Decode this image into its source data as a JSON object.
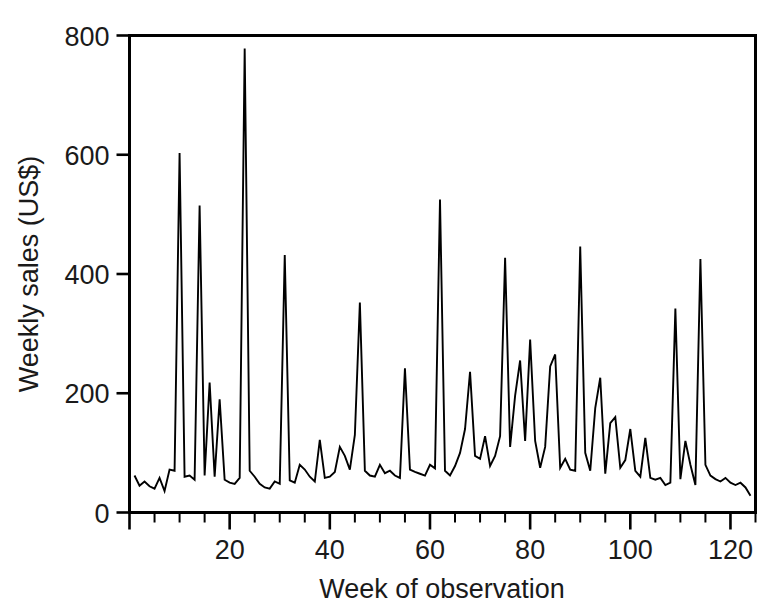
{
  "chart_data": {
    "type": "line",
    "title": "",
    "xlabel": "Week of observation",
    "ylabel": "Weekly sales (US$)",
    "xlim": [
      0,
      125
    ],
    "ylim": [
      0,
      800
    ],
    "grid": false,
    "legend": null,
    "x_ticks_major": [
      0,
      20,
      40,
      60,
      80,
      100,
      120
    ],
    "x_tick_labels": [
      "",
      "20",
      "40",
      "60",
      "80",
      "100",
      "120"
    ],
    "x_tick_minor_step": 5,
    "y_ticks_major": [
      0,
      200,
      400,
      600,
      800
    ],
    "y_tick_labels": [
      "0",
      "200",
      "400",
      "600",
      "800"
    ],
    "series_name": "Weekly sales",
    "line_color": "#000000",
    "x": [
      1,
      2,
      3,
      4,
      5,
      6,
      7,
      8,
      9,
      10,
      11,
      12,
      13,
      14,
      15,
      16,
      17,
      18,
      19,
      20,
      21,
      22,
      23,
      24,
      25,
      26,
      27,
      28,
      29,
      30,
      31,
      32,
      33,
      34,
      35,
      36,
      37,
      38,
      39,
      40,
      41,
      42,
      43,
      44,
      45,
      46,
      47,
      48,
      49,
      50,
      51,
      52,
      53,
      54,
      55,
      56,
      57,
      58,
      59,
      60,
      61,
      62,
      63,
      64,
      65,
      66,
      67,
      68,
      69,
      70,
      71,
      72,
      73,
      74,
      75,
      76,
      77,
      78,
      79,
      80,
      81,
      82,
      83,
      84,
      85,
      86,
      87,
      88,
      89,
      90,
      91,
      92,
      93,
      94,
      95,
      96,
      97,
      98,
      99,
      100,
      101,
      102,
      103,
      104,
      105,
      106,
      107,
      108,
      109,
      110,
      111,
      112,
      113,
      114,
      115,
      116,
      117,
      118,
      119,
      120,
      121,
      122,
      123,
      124
    ],
    "values": [
      62,
      45,
      52,
      44,
      40,
      58,
      36,
      72,
      70,
      603,
      60,
      62,
      55,
      515,
      62,
      218,
      60,
      190,
      55,
      50,
      48,
      58,
      778,
      70,
      60,
      48,
      42,
      40,
      52,
      48,
      432,
      54,
      50,
      80,
      72,
      60,
      52,
      122,
      58,
      60,
      68,
      110,
      95,
      72,
      130,
      352,
      70,
      62,
      60,
      80,
      66,
      70,
      62,
      58,
      242,
      72,
      68,
      65,
      62,
      80,
      74,
      525,
      70,
      62,
      78,
      100,
      140,
      236,
      95,
      90,
      128,
      78,
      95,
      128,
      427,
      110,
      196,
      255,
      120,
      290,
      120,
      75,
      110,
      245,
      265,
      75,
      90,
      72,
      70,
      446,
      100,
      70,
      175,
      226,
      65,
      150,
      160,
      75,
      88,
      140,
      70,
      60,
      125,
      58,
      55,
      58,
      46,
      50,
      342,
      56,
      120,
      80,
      46,
      425,
      80,
      62,
      56,
      52,
      58,
      50,
      46,
      50,
      42,
      28
    ]
  },
  "axis": {
    "y_label_text": "Weekly sales (US$)",
    "x_label_text": "Week of observation"
  }
}
